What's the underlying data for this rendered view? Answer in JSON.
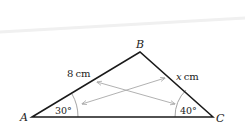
{
  "diagram": {
    "type": "triangle",
    "vertices": {
      "A": {
        "label": "A",
        "x": 32,
        "y": 117
      },
      "B": {
        "label": "B",
        "x": 140,
        "y": 52
      },
      "C": {
        "label": "C",
        "x": 213,
        "y": 117
      }
    },
    "sides": {
      "AB": {
        "label_value": "8",
        "label_unit": "cm"
      },
      "BC": {
        "label_value": "x",
        "label_unit": "cm"
      }
    },
    "angles": {
      "A": {
        "label": "30°"
      },
      "C": {
        "label": "40°"
      }
    },
    "colors": {
      "stroke": "#1a1a1a",
      "arc": "#9a9a9a",
      "arrow": "#a8a8a8",
      "text": "#222222"
    }
  }
}
